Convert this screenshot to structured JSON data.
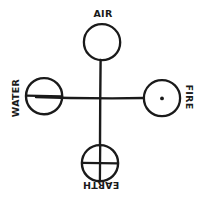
{
  "diagram": {
    "style": "hand-drawn ink line art",
    "background_color": "#ffffff",
    "ink_color": "#1a1a1a",
    "center": {
      "x": 100,
      "y": 98
    },
    "nodes": [
      {
        "id": "air",
        "label": "AIR",
        "position": "top",
        "symbol": "empty-circle",
        "label_rotation_deg": 0,
        "circle": {
          "cx": 102,
          "cy": 42,
          "r": 18
        },
        "label_x": 103,
        "label_y": 17
      },
      {
        "id": "water",
        "label": "WATER",
        "position": "left",
        "symbol": "circle-with-horizontal-bar",
        "label_rotation_deg": -90,
        "circle": {
          "cx": 44,
          "cy": 96,
          "r": 18
        },
        "label_x": 19,
        "label_y": 98
      },
      {
        "id": "fire",
        "label": "FIRE",
        "position": "right",
        "symbol": "circle-with-center-dot",
        "label_rotation_deg": 90,
        "circle": {
          "cx": 162,
          "cy": 98,
          "r": 18
        },
        "label_x": 185,
        "label_y": 97
      },
      {
        "id": "earth",
        "label": "EARTH",
        "position": "bottom",
        "symbol": "circle-with-quartering-cross",
        "label_rotation_deg": 180,
        "circle": {
          "cx": 100,
          "cy": 163,
          "r": 18
        },
        "label_x": 101,
        "label_y": 189
      }
    ],
    "axes": {
      "vertical": {
        "x": 100,
        "y_top": 60,
        "y_bottom": 146
      },
      "horizontal": {
        "y": 98,
        "x_left": 36,
        "x_right": 144
      }
    }
  }
}
